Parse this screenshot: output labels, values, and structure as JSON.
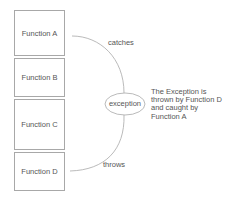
{
  "diagram": {
    "functions": [
      {
        "id": "A",
        "label": "Function A"
      },
      {
        "id": "B",
        "label": "Function B"
      },
      {
        "id": "C",
        "label": "Function C"
      },
      {
        "id": "D",
        "label": "Function D"
      }
    ],
    "exception_node": {
      "label": "exception"
    },
    "edges": [
      {
        "from": "Function A",
        "to": "exception",
        "label": "catches"
      },
      {
        "from": "Function D",
        "to": "exception",
        "label": "throws"
      }
    ],
    "note": {
      "lines": [
        "The Exception is",
        "thrown by Function D",
        "and caught by",
        "Function A"
      ]
    },
    "colors": {
      "stroke": "#a8a8a8",
      "text": "#555555",
      "background": "#ffffff"
    }
  }
}
